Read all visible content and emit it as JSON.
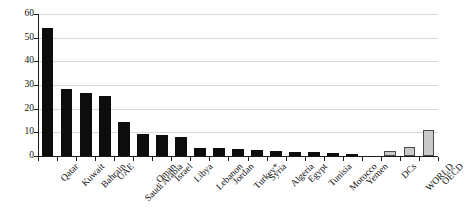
{
  "chart_data": {
    "type": "bar",
    "title": "",
    "subtitle": "",
    "xlabel": "",
    "ylabel": "",
    "ylim": [
      0,
      60
    ],
    "yticks": [
      0,
      10,
      20,
      30,
      40,
      50,
      60
    ],
    "ytick_labels": [
      "0",
      "10",
      "20",
      "30",
      "40",
      "50",
      "60"
    ],
    "grid": true,
    "grid_axis": "y",
    "legend": false,
    "legend_position": "none",
    "annotations": [
      "Turkey*"
    ],
    "categories": [
      "Qatar",
      "Kuwait",
      "Bahrain",
      "UAE",
      "Saudi Arabia",
      "Oman",
      "Israel",
      "Libya",
      "Lebanon",
      "Jordan",
      "Turkey*",
      "Syria",
      "Algeria",
      "Egypt",
      "Tunisia",
      "Morocco",
      "Yemen",
      "",
      "DCs",
      "WORLD",
      "OECD"
    ],
    "values": [
      54.1,
      28.2,
      26.6,
      25.4,
      14.3,
      9.4,
      8.8,
      8.2,
      3.2,
      3.2,
      2.8,
      2.6,
      2.3,
      1.8,
      1.8,
      1.1,
      0.7,
      null,
      2.0,
      3.9,
      10.8
    ],
    "bar_colors": [
      "#0d0d0d",
      "#0d0d0d",
      "#0d0d0d",
      "#0d0d0d",
      "#0d0d0d",
      "#0d0d0d",
      "#0d0d0d",
      "#0d0d0d",
      "#0d0d0d",
      "#0d0d0d",
      "#0d0d0d",
      "#0d0d0d",
      "#0d0d0d",
      "#0d0d0d",
      "#0d0d0d",
      "#0d0d0d",
      "#0d0d0d",
      "none",
      "#c9c9c9",
      "#c9c9c9",
      "#c9c9c9"
    ],
    "series": [
      {
        "name": "value",
        "values": [
          54.1,
          28.2,
          26.6,
          25.4,
          14.3,
          9.4,
          8.8,
          8.2,
          3.2,
          3.2,
          2.8,
          2.6,
          2.3,
          1.8,
          1.8,
          1.1,
          0.7,
          null,
          2.0,
          3.9,
          10.8
        ]
      }
    ],
    "colors": {
      "country_bar": "#0d0d0d",
      "aggregate_bar": "#c9c9c9",
      "aggregate_bar_edge": "#4a4a4a",
      "gridline": "#d8d8d8",
      "axis": "#1a1a1a",
      "background": "#ffffff",
      "text": "#111111"
    }
  }
}
